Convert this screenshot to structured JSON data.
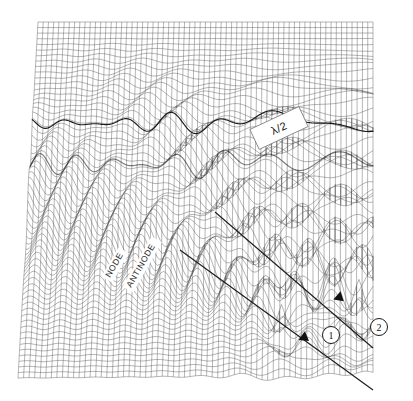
{
  "figure": {
    "kind": "3d-wireframe-surface",
    "title": "",
    "background_color": "#ffffff",
    "mesh_color": "#5a5a5a",
    "crest_color": "#111111",
    "annotation_color": "#262626"
  },
  "annotations": {
    "node_label": "NODE",
    "antinode_label": "ANTINODE",
    "half_wavelength_label": "λ/2",
    "ray_one_label": "1",
    "ray_two_label": "2"
  },
  "chart_data": {
    "type": "surface",
    "title": "",
    "xlabel": "",
    "ylabel": "",
    "zlabel": "",
    "grid": true,
    "legend": false,
    "projection": {
      "corner_top_left": [
        38,
        22
      ],
      "corner_top_right": [
        373,
        22
      ],
      "corner_bottom_right": [
        373,
        375
      ],
      "corner_bottom_left": [
        18,
        378
      ],
      "nx": 64,
      "ny": 64,
      "z_scale": 34
    },
    "sources": [
      {
        "name": "1",
        "u": 0.74,
        "v": 0.86,
        "wavelength": 0.092,
        "amplitude": 1.0
      },
      {
        "name": "2",
        "u": 0.96,
        "v": 0.8,
        "wavelength": 0.092,
        "amplitude": 1.0
      }
    ],
    "standing_wave": {
      "wavelength_fraction": 0.5,
      "node_count": 9,
      "antinode_count": 9
    },
    "annotations_on_plot": [
      {
        "text": "NODE",
        "u": 0.2,
        "v": 0.68,
        "rotation_deg": -60
      },
      {
        "text": "ANTINODE",
        "u": 0.3,
        "v": 0.62,
        "rotation_deg": -60
      },
      {
        "text": "λ/2",
        "u": 0.68,
        "v": 0.3,
        "rotation_deg": -25,
        "boxed": true
      },
      {
        "text": "1",
        "u": 0.8,
        "v": 0.86,
        "circled": true
      },
      {
        "text": "2",
        "u": 0.99,
        "v": 0.83,
        "circled": true
      }
    ],
    "rays": [
      {
        "name": "ray-1",
        "from": [
          180,
          250
        ],
        "to": [
          373,
          390
        ],
        "arrow_at": [
          305,
          338
        ]
      },
      {
        "name": "ray-2",
        "from": [
          215,
          212
        ],
        "to": [
          373,
          348
        ],
        "arrow_at": [
          340,
          298
        ]
      }
    ]
  }
}
